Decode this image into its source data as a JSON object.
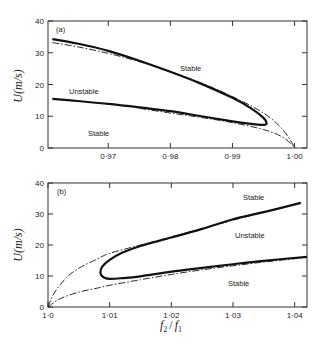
{
  "chart_data": [
    {
      "type": "line",
      "panel": "(a)",
      "xlabel": "",
      "ylabel": "U(m/s)",
      "xlim": [
        0.9603,
        1.002
      ],
      "ylim": [
        0,
        40
      ],
      "xticks": [
        0.97,
        0.98,
        0.99,
        1.0
      ],
      "xtick_labels": [
        "0·97",
        "0·98",
        "0·99",
        "1·00"
      ],
      "yticks": [
        0,
        10,
        20,
        30,
        40
      ],
      "ytick_labels": [
        "0",
        "10",
        "20",
        "30",
        "40"
      ],
      "grid": false,
      "annotations": [
        {
          "text": "(a)",
          "x": 0.9615,
          "y": 38
        },
        {
          "text": "Stable",
          "x": 0.9855,
          "y": 25.5
        },
        {
          "text": "Unstable",
          "x": 0.9665,
          "y": 17.7
        },
        {
          "text": "Stable",
          "x": 0.9728,
          "y": 4.5
        }
      ],
      "series": [
        {
          "name": "stability boundary (solid)",
          "style": "solid-thick",
          "x": [
            0.961,
            0.965,
            0.97,
            0.975,
            0.98,
            0.985,
            0.99,
            0.993,
            0.995,
            0.9955,
            0.995,
            0.993,
            0.99,
            0.985,
            0.98,
            0.975,
            0.97,
            0.965,
            0.961
          ],
          "y": [
            34.3,
            32.9,
            30.6,
            27.5,
            24.0,
            20.2,
            15.8,
            12.5,
            9.5,
            7.8,
            7.3,
            7.6,
            8.4,
            10.0,
            11.6,
            12.8,
            13.9,
            14.8,
            15.5
          ]
        },
        {
          "name": "approximate boundary (dash-dot)",
          "style": "dash-dot",
          "x": [
            0.961,
            0.965,
            0.97,
            0.975,
            0.98,
            0.985,
            0.99,
            0.995,
            0.998,
            1.0
          ],
          "y": [
            33.2,
            31.9,
            29.8,
            27.2,
            24.0,
            20.4,
            16.2,
            11.0,
            6.0,
            0.3
          ]
        },
        {
          "name": "approximate boundary lower (dash-dot)",
          "style": "dash-dot",
          "x": [
            0.975,
            0.98,
            0.985,
            0.99,
            0.995,
            0.998,
            1.0
          ],
          "y": [
            12.5,
            11.0,
            9.6,
            8.0,
            5.8,
            3.5,
            0.3
          ]
        }
      ]
    },
    {
      "type": "line",
      "panel": "(b)",
      "xlabel": "f2 / f1",
      "ylabel": "U(m/s)",
      "xlim": [
        1.0,
        1.042
      ],
      "ylim": [
        0,
        40
      ],
      "xticks": [
        1.0,
        1.01,
        1.02,
        1.03,
        1.04
      ],
      "xtick_labels": [
        "1·0",
        "1·01",
        "1·02",
        "1·03",
        "1·04"
      ],
      "yticks": [
        0,
        10,
        20,
        30,
        40
      ],
      "ytick_labels": [
        "0",
        "10",
        "20",
        "30",
        "40"
      ],
      "grid": false,
      "annotations": [
        {
          "text": "(b)",
          "x": 1.0015,
          "y": 38
        },
        {
          "text": "Stable",
          "x": 1.0355,
          "y": 35.2
        },
        {
          "text": "Unstable",
          "x": 1.0355,
          "y": 23.4
        },
        {
          "text": "Stable",
          "x": 1.034,
          "y": 8.6
        }
      ],
      "series": [
        {
          "name": "stability boundary (solid)",
          "style": "solid-thick",
          "x": [
            1.041,
            1.035,
            1.03,
            1.025,
            1.02,
            1.015,
            1.012,
            1.01,
            1.0088,
            1.0085,
            1.009,
            1.01,
            1.012,
            1.015,
            1.02,
            1.025,
            1.03,
            1.035,
            1.042
          ],
          "y": [
            33.6,
            30.6,
            28.3,
            25.2,
            22.4,
            19.7,
            17.5,
            15.2,
            13.0,
            11.0,
            9.6,
            9.1,
            9.3,
            9.9,
            11.4,
            12.6,
            13.8,
            14.9,
            16.2
          ]
        },
        {
          "name": "approximate boundary upper (dash-dot)",
          "style": "dash-dot",
          "x": [
            1.0,
            1.001,
            1.003,
            1.005,
            1.008,
            1.01,
            1.015,
            1.02,
            1.025,
            1.03,
            1.035,
            1.041
          ],
          "y": [
            0,
            4.5,
            9.5,
            12.5,
            15.5,
            17.3,
            20.0,
            22.6,
            25.3,
            28.0,
            30.6,
            33.6
          ]
        },
        {
          "name": "approximate boundary lower (dash-dot)",
          "style": "dash-dot",
          "x": [
            1.0,
            1.002,
            1.005,
            1.008,
            1.01,
            1.015,
            1.02,
            1.025,
            1.03,
            1.035,
            1.042
          ],
          "y": [
            0,
            2.7,
            4.8,
            6.1,
            7.0,
            8.8,
            10.5,
            12.0,
            13.3,
            14.5,
            16.0
          ]
        }
      ]
    }
  ],
  "labels": {
    "panel_a": "(a)",
    "panel_b": "(b)",
    "y_axis": "U(m/s)",
    "x_axis_f2": "f",
    "x_axis_sub2": "2",
    "x_axis_slash": "/",
    "x_axis_f1": "f",
    "x_axis_sub1": "1",
    "stable": "Stable",
    "unstable": "Unstable"
  }
}
